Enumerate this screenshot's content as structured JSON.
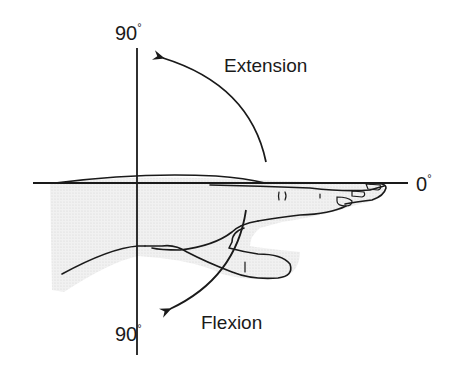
{
  "diagram": {
    "labels": {
      "top_angle": "90",
      "bottom_angle": "90",
      "neutral_angle": "0",
      "degree_symbol": "°",
      "extension": "Extension",
      "flexion": "Flexion"
    },
    "colors": {
      "line": "#1a1a1a",
      "hand_shading": "#ececec",
      "background": "#ffffff"
    }
  }
}
